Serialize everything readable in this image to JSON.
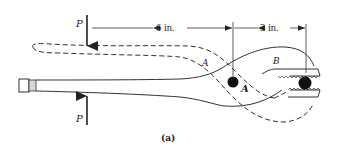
{
  "figure": {
    "caption": "(a)",
    "forces": [
      {
        "label": "P",
        "position": "top",
        "direction": "down"
      },
      {
        "label": "P",
        "position": "bottom",
        "direction": "up"
      }
    ],
    "dimensions": [
      {
        "label": "6 in.",
        "from": "force P",
        "to": "pivot A"
      },
      {
        "label": "3 in.",
        "from": "pivot A",
        "to": "jaw ball"
      }
    ],
    "points": {
      "pivot": "A",
      "member_a": "A",
      "member_b": "B"
    },
    "colors": {
      "ink": "#222222",
      "background": "#ffffff"
    }
  }
}
